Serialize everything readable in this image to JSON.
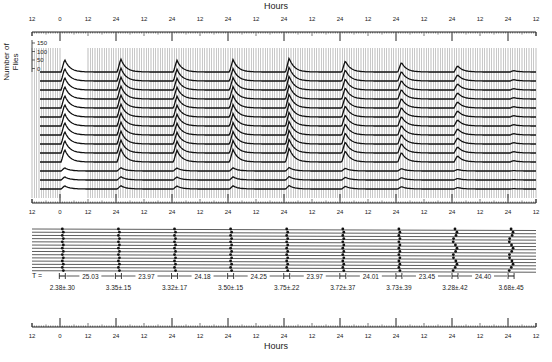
{
  "figure": {
    "top_axis_title": "Hours",
    "bottom_axis_title": "Hours",
    "y_axis_title_line1": "Number of",
    "y_axis_title_line2": "Flies",
    "y_scale_ticks": [
      "150",
      "100",
      "50",
      "0"
    ],
    "period_prefix": "T ="
  },
  "chart_data": [
    {
      "type": "line",
      "title": "Eclosion profiles (stacked traces)",
      "xlabel": "Hours",
      "ylabel": "Number of Flies",
      "x_tick_labels": [
        "12",
        "0",
        "12",
        "24",
        "12",
        "24",
        "12",
        "24",
        "12",
        "24",
        "12",
        "24",
        "12",
        "24",
        "12",
        "24",
        "12",
        "24",
        "12"
      ],
      "y_ticks": [
        0,
        50,
        100,
        150
      ],
      "n_traces": 14,
      "grid": "vertical lines every hour",
      "peak_cycles": 9,
      "peak_heights_relative": [
        0.9,
        0.95,
        0.85,
        0.9,
        1.0,
        0.8,
        0.7,
        0.45,
        0.1
      ]
    },
    {
      "type": "scatter",
      "title": "Gate phases and intervals",
      "xlabel": "Hours",
      "x_tick_labels": [
        "12",
        "0",
        "12",
        "24",
        "12",
        "24",
        "12",
        "24",
        "12",
        "24",
        "12",
        "24",
        "12",
        "24",
        "12",
        "24",
        "12",
        "24",
        "12"
      ],
      "n_rows": 14,
      "gate_widths": [
        "2.38±.30",
        "3.35±.15",
        "3.32±.17",
        "3.50±.15",
        "3.75±.22",
        "3.72±.37",
        "3.73±.39",
        "3.28±.42",
        "3.68±.45"
      ],
      "intervals_T": [
        "25.03",
        "23.97",
        "24.18",
        "24.25",
        "23.97",
        "24.01",
        "23.45",
        "24.40"
      ]
    }
  ]
}
